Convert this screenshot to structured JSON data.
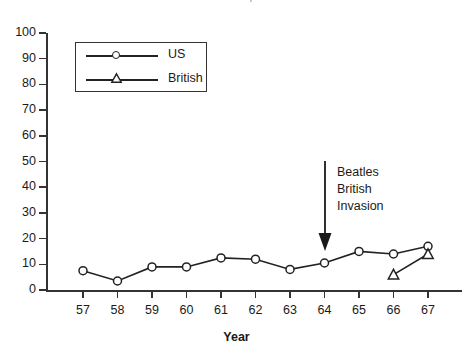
{
  "page": {
    "cropped_header_left": "222",
    "cropped_header_title": "The Beatles Report"
  },
  "chart_data": {
    "type": "line",
    "title": "",
    "xlabel": "Year",
    "ylabel": "",
    "categories": [
      "57",
      "58",
      "59",
      "60",
      "61",
      "62",
      "63",
      "64",
      "65",
      "66",
      "67"
    ],
    "x": [
      1957,
      1958,
      1959,
      1960,
      1961,
      1962,
      1963,
      1964,
      1965,
      1966,
      1967
    ],
    "series": [
      {
        "name": "US",
        "marker": "circle",
        "values": [
          7.5,
          3.5,
          9,
          9,
          12.5,
          12,
          8,
          10.5,
          15,
          14,
          17
        ]
      },
      {
        "name": "British",
        "marker": "triangle",
        "values": [
          null,
          null,
          null,
          null,
          null,
          null,
          null,
          null,
          null,
          6,
          14
        ]
      }
    ],
    "ylim": [
      0,
      100
    ],
    "ytick_values": [
      0,
      10,
      20,
      30,
      40,
      50,
      60,
      70,
      80,
      90,
      100
    ],
    "ytick_labels": [
      "0",
      "10",
      "20",
      "30",
      "40",
      "50",
      "60",
      "70",
      "80",
      "90",
      "100"
    ],
    "xtick_labels": [
      "57",
      "58",
      "59",
      "60",
      "61",
      "62",
      "63",
      "64",
      "65",
      "66",
      "67"
    ],
    "grid": false,
    "legend_position": "upper-left",
    "legend_entries": [
      "US",
      "British"
    ],
    "annotations": [
      {
        "text_lines": [
          "Beatles",
          "British",
          "Invasion"
        ],
        "arrow": "down-arrow",
        "points_at_year": "64"
      }
    ],
    "colors": {
      "line": "#222222",
      "axis": "#333333",
      "text": "#1a1a1a",
      "background": "#ffffff"
    }
  }
}
